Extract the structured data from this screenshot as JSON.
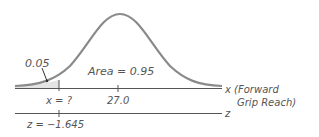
{
  "diagram": {
    "type": "normal-distribution-curve",
    "left_tail_area": "0.05",
    "center_area_label": "Area = 0.95",
    "x_axis": {
      "label_line1": "x (Forward",
      "label_line2": "Grip Reach)",
      "tick_unknown": "x = ?",
      "tick_mean": "27.0"
    },
    "z_axis": {
      "label": "z",
      "tick_value": "z = −1.645"
    },
    "colors": {
      "curve": "#8a8a8a",
      "axis": "#555555",
      "shade": "#e4e4e4",
      "text": "#555555"
    }
  }
}
